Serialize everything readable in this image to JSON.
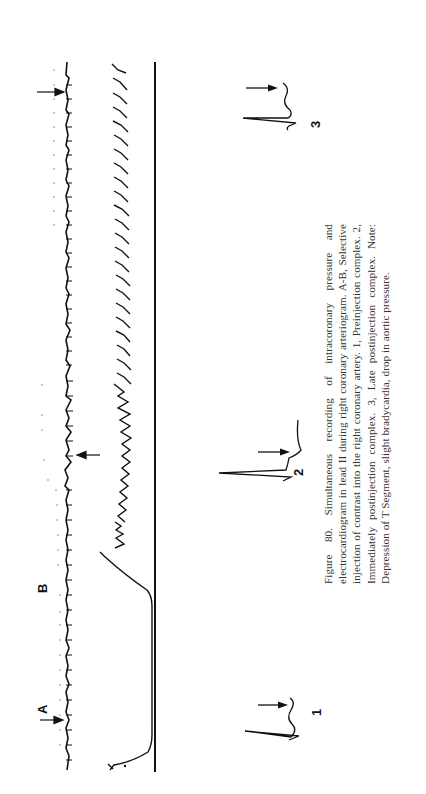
{
  "figure": {
    "number": "Figure 80.",
    "caption": "Simultaneous recording of intracoronary pressure and electrocardiogram in lead II during right coronary arteriogram. A-B, Selective injection of contrast into the right coronary artery. 1, Preinjection complex. 2, Immediately postinjection complex. 3, Late postinjection complex. Note: Depression of T Segment, slight bradycardia, drop in aortic pressure.",
    "orientation": "rotated 90° counter-clockwise",
    "markers": {
      "a": "A",
      "b": "B"
    },
    "traces": [
      {
        "name": "ECG lead II"
      },
      {
        "name": "Intracoronary pressure"
      },
      {
        "name": "Baseline"
      }
    ],
    "insets": [
      {
        "label": "1",
        "description": "Preinjection complex"
      },
      {
        "label": "2",
        "description": "Immediately postinjection complex"
      },
      {
        "label": "3",
        "description": "Late postinjection complex"
      }
    ]
  }
}
